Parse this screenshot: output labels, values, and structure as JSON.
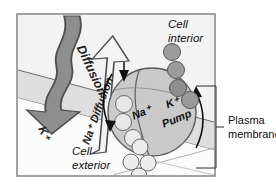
{
  "figure": {
    "frame_color": "#7a7a7a",
    "background_color": "#ffffff"
  },
  "membrane": {
    "label": "Plasma membrane",
    "band_fill": "#dcdcdc",
    "band_edge": "#6e6e6e",
    "bracket_color": "#4a4a4a"
  },
  "regions": {
    "interior_label": "Cell\ninterior",
    "interior_line1": "Cell",
    "interior_line2": "interior",
    "exterior_line1": "Cell",
    "exterior_line2": "exterior",
    "interior_fill": "#f2f2f2",
    "exterior_fill": "#fbfbfb"
  },
  "arrows": {
    "diffusion_dark": {
      "label": "Diffusion",
      "ion_label": "K+",
      "ion_label_display": "K⁺",
      "fill": "#8a8a8a",
      "stroke": "#4d4d4d",
      "direction": "down-left",
      "description": "potassium diffusion out of cell"
    },
    "diffusion_light": {
      "label": "Na+ Diffusion",
      "label_display": "Na⁺ Diffusion",
      "fill": "#f4f4f4",
      "stroke": "#4d4d4d",
      "direction": "up-right",
      "description": "sodium diffusion into cell"
    },
    "pump_cycle_left": {
      "name": "pump-rotation-left",
      "direction": "downward",
      "color": "#111111"
    },
    "pump_cycle_right": {
      "name": "pump-rotation-right",
      "direction": "upward",
      "color": "#111111"
    }
  },
  "pump": {
    "name": "sodium-potassium-pump",
    "label_left": "Na+",
    "label_left_display": "Na⁺",
    "label_right_line1": "K+",
    "label_right_line1_display": "K⁺",
    "label_right_line2": "Pump",
    "fill": "#c9c9c9",
    "stroke": "#5a5a5a"
  },
  "ions": {
    "dark_chain": {
      "name": "sodium-ions-interior",
      "count": 4,
      "fill": "#9a9a9a",
      "stroke": "#555555"
    },
    "light_pump": {
      "name": "potassium-ions-in-pump",
      "count": 3,
      "fill": "#e6e6e6",
      "stroke": "#666666"
    },
    "light_exterior": {
      "name": "potassium-ions-exterior",
      "count": 4,
      "fill": "#ececec",
      "stroke": "#6a6a6a"
    }
  }
}
